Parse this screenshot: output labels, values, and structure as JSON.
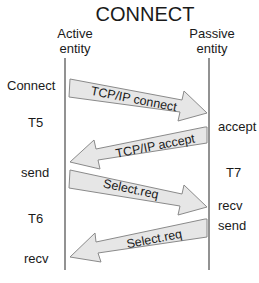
{
  "title": "CONNECT",
  "entities": {
    "active": {
      "line1": "Active",
      "line2": "entity"
    },
    "passive": {
      "line1": "Passive",
      "line2": "entity"
    }
  },
  "left_labels": [
    "Connect",
    "T5",
    "send",
    "T6",
    "recv"
  ],
  "right_labels": [
    "accept",
    "T7",
    "recv",
    "send"
  ],
  "messages": [
    {
      "label": "TCP/IP connect",
      "direction": "active-to-passive"
    },
    {
      "label": "TCP/IP accept",
      "direction": "passive-to-active"
    },
    {
      "label": "Select.req",
      "direction": "active-to-passive"
    },
    {
      "label": "Select.req",
      "direction": "passive-to-active"
    }
  ],
  "colors": {
    "arrow_fill": "#e6e6e6",
    "arrow_stroke": "#8a8a8a",
    "lifeline": "#6e6e6e",
    "text": "#1a1a1a"
  }
}
